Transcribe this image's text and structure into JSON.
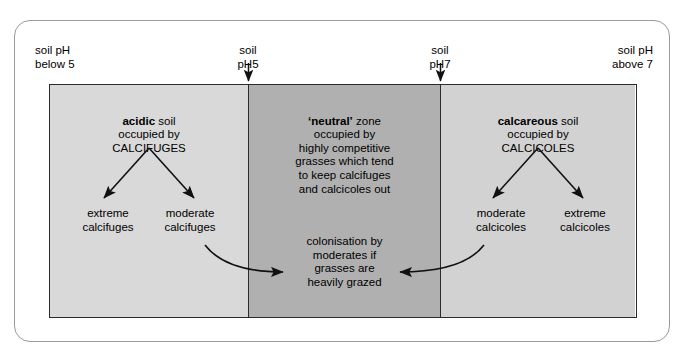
{
  "diagram": {
    "colors": {
      "acidic_zone": "#d9d9d9",
      "neutral_zone": "#b0b0b0",
      "calcareous_zone": "#d2d2d2",
      "border": "#2b2b2b",
      "frame": "#9a9a9a",
      "text": "#000000",
      "background": "#ffffff"
    },
    "axis_headers": {
      "left": "soil pH\nbelow 5",
      "mid_left": "soil\npH5",
      "mid_right": "soil\npH7",
      "right": "soil pH\nabove 7"
    },
    "zones": [
      {
        "id": "acidic",
        "heading_bold": "acidic",
        "heading_rest": " soil",
        "heading_lines": "occupied by\nCALCIFUGES",
        "outcomes": [
          "extreme\ncalcifuges",
          "moderate\ncalcifuges"
        ]
      },
      {
        "id": "neutral",
        "heading_bold": "‘neutral’",
        "heading_rest": " zone",
        "heading_lines": "occupied by\nhighly competitive\ngrasses which tend\nto keep calcifuges\nand calcicoles out",
        "outcomes": []
      },
      {
        "id": "calcareous",
        "heading_bold": "calcareous",
        "heading_rest": " soil",
        "heading_lines": "occupied by\nCALCICOLES",
        "outcomes": [
          "moderate\ncalcicoles",
          "extreme\ncalcicoles"
        ]
      }
    ],
    "colonisation_note": "colonisation by\nmoderates if\ngrasses are\nheavily grazed",
    "icons": {
      "down_arrow_ph5": "down-arrow-icon",
      "down_arrow_ph7": "down-arrow-icon",
      "split_arrows_left": "branching-arrows-icon",
      "split_arrows_right": "branching-arrows-icon",
      "curved_arrow_left": "curved-arrow-right-icon",
      "curved_arrow_right": "curved-arrow-left-icon"
    }
  }
}
